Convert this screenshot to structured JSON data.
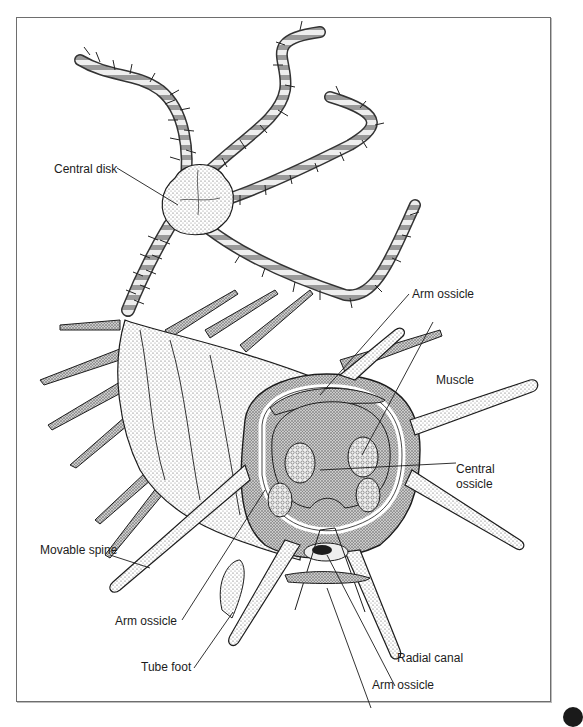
{
  "figure": {
    "colors": {
      "ink": "#1c1c1c",
      "stipple": "#8a8a8a",
      "frame": "#6e6e6e",
      "paper": "#ffffff"
    }
  },
  "labels": [
    {
      "id": "central-disk",
      "text": "Central disk"
    },
    {
      "id": "arm-ossicle-top",
      "text": "Arm ossicle"
    },
    {
      "id": "muscle",
      "text": "Muscle"
    },
    {
      "id": "central-ossicle-1",
      "text": "Central"
    },
    {
      "id": "central-ossicle-2",
      "text": "ossicle"
    },
    {
      "id": "movable-spine",
      "text": "Movable spine"
    },
    {
      "id": "arm-ossicle-left",
      "text": "Arm ossicle"
    },
    {
      "id": "tube-foot",
      "text": "Tube foot"
    },
    {
      "id": "radial-canal",
      "text": "Radial canal"
    },
    {
      "id": "arm-ossicle-bottom",
      "text": "Arm ossicle"
    }
  ]
}
